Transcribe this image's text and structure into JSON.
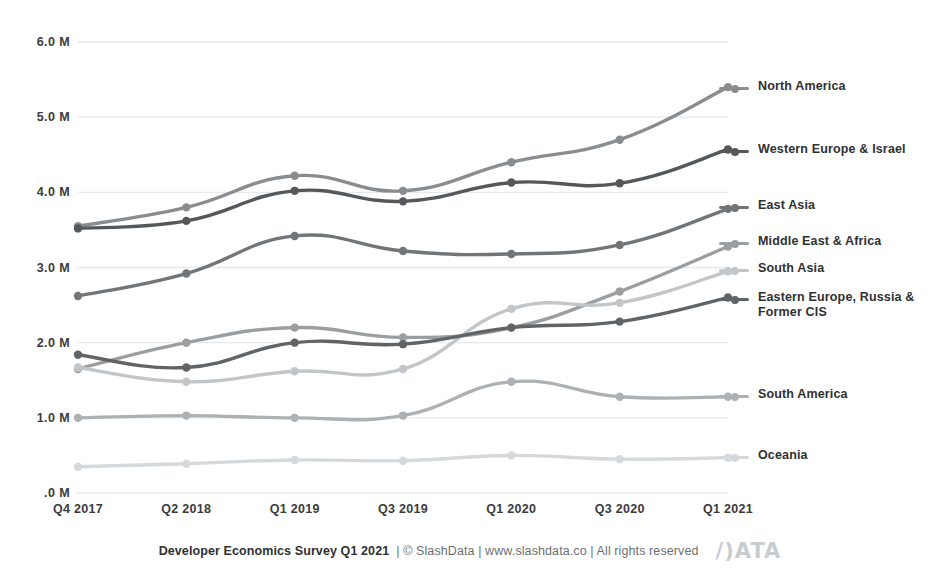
{
  "chart_data": {
    "type": "line",
    "title": "",
    "xlabel": "",
    "ylabel": "",
    "categories": [
      "Q4 2017",
      "Q2 2018",
      "Q1 2019",
      "Q3 2019",
      "Q1 2020",
      "Q3 2020",
      "Q1 2021"
    ],
    "ylim": [
      0,
      6
    ],
    "yticks": [
      0,
      1,
      2,
      3,
      4,
      5,
      6
    ],
    "ytick_labels": [
      ".0 M",
      "1.0 M",
      "2.0 M",
      "3.0 M",
      "4.0 M",
      "5.0 M",
      "6.0 M"
    ],
    "grid": true,
    "legend_position": "right",
    "units": "millions of developers",
    "series": [
      {
        "name": "North America",
        "color": "#8a8d90",
        "values": [
          3.55,
          3.8,
          4.22,
          4.02,
          4.4,
          4.7,
          5.4
        ]
      },
      {
        "name": "Western Europe & Israel",
        "color": "#55585b",
        "values": [
          3.52,
          3.62,
          4.02,
          3.88,
          4.13,
          4.12,
          4.57
        ]
      },
      {
        "name": "East Asia",
        "color": "#727578",
        "values": [
          2.62,
          2.92,
          3.42,
          3.22,
          3.18,
          3.3,
          3.78
        ]
      },
      {
        "name": "Middle East & Africa",
        "color": "#9b9ea1",
        "values": [
          1.65,
          2.0,
          2.2,
          2.07,
          2.2,
          2.68,
          3.28
        ]
      },
      {
        "name": "South Asia",
        "color": "#c3c6c9",
        "values": [
          1.67,
          1.48,
          1.62,
          1.65,
          2.45,
          2.53,
          2.95
        ]
      },
      {
        "name": "Eastern Europe, Russia &\nFormer CIS",
        "color": "#616467",
        "values": [
          1.84,
          1.67,
          2.0,
          1.98,
          2.2,
          2.28,
          2.6
        ]
      },
      {
        "name": "South America",
        "color": "#aeb1b4",
        "values": [
          1.0,
          1.03,
          1.0,
          1.03,
          1.48,
          1.28,
          1.28
        ]
      },
      {
        "name": "Oceania",
        "color": "#d6d9dc",
        "values": [
          0.35,
          0.39,
          0.44,
          0.43,
          0.5,
          0.45,
          0.47
        ]
      }
    ]
  },
  "legend": {
    "items": [
      {
        "label": "North America",
        "swatch_color": "#8a8d90",
        "y": 86
      },
      {
        "label": "Western Europe & Israel",
        "swatch_color": "#55585b",
        "y": 149
      },
      {
        "label": "East Asia",
        "swatch_color": "#727578",
        "y": 205
      },
      {
        "label": "Middle East & Africa",
        "swatch_color": "#9b9ea1",
        "y": 241
      },
      {
        "label": "South Asia",
        "swatch_color": "#c3c6c9",
        "y": 268
      },
      {
        "label": "Eastern Europe, Russia &\nFormer CIS",
        "swatch_color": "#616467",
        "y": 297
      },
      {
        "label": "South America",
        "swatch_color": "#aeb1b4",
        "y": 394
      },
      {
        "label": "Oceania",
        "swatch_color": "#d6d9dc",
        "y": 455
      }
    ]
  },
  "footer": {
    "title": "Developer Economics Survey Q1 2021",
    "meta": "| © SlashData | www.slashdata.co | All rights reserved",
    "logo": "/)ATA"
  },
  "colors": {
    "grid": "#e6e8ea",
    "tick_text": "#3b3b3b",
    "footer_text": "#2f3133",
    "footer_meta": "#6d7073",
    "logo": "#c9cccf",
    "background": "#ffffff"
  }
}
